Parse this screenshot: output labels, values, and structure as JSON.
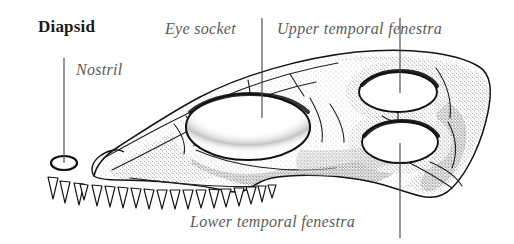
{
  "figure": {
    "title": "Diapsid",
    "background_color": "#ffffff",
    "ink_color": "#1a1a1a",
    "label_color": "#5b5b5b",
    "stipple_color": "#7d7d7d",
    "width": 514,
    "height": 244
  },
  "labels": {
    "title": "Diapsid",
    "eye_socket": "Eye socket",
    "upper_temporal_fenestra": "Upper temporal fenestra",
    "nostril": "Nostril",
    "lower_temporal_fenestra": "Lower temporal fenestra"
  },
  "leader_lines": [
    {
      "name": "nostril-leader",
      "x1": 64,
      "y1": 58,
      "x2": 64,
      "y2": 163
    },
    {
      "name": "eye-socket-leader",
      "x1": 262,
      "y1": 18,
      "x2": 262,
      "y2": 118
    },
    {
      "name": "upper-fenestra-leader",
      "x1": 400,
      "y1": 18,
      "x2": 400,
      "y2": 93
    },
    {
      "name": "lower-fenestra-leader",
      "x1": 400,
      "y1": 143,
      "x2": 400,
      "y2": 238
    }
  ],
  "openings": [
    {
      "name": "nostril",
      "cx": 64,
      "cy": 163,
      "rx": 13,
      "ry": 7
    },
    {
      "name": "eye-socket",
      "cx": 248,
      "cy": 127,
      "rx": 62,
      "ry": 33
    },
    {
      "name": "upper-temporal-fenestra",
      "cx": 398,
      "cy": 92,
      "rx": 39,
      "ry": 20
    },
    {
      "name": "lower-temporal-fenestra",
      "cx": 400,
      "cy": 142,
      "rx": 38,
      "ry": 21
    }
  ],
  "teeth": {
    "count": 19,
    "start_x": 45,
    "end_x": 256,
    "height_range": [
      14,
      22
    ]
  }
}
